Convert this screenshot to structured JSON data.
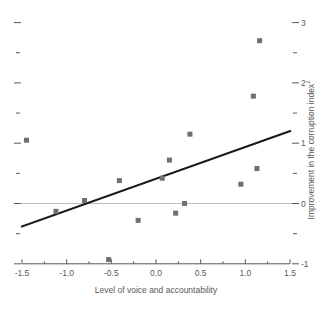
{
  "chart_data": {
    "type": "scatter",
    "title": "",
    "xlabel": "Level of voice and accountability",
    "ylabel": "Improvement in the corruption index²",
    "ylabel_text": "Improvement in the corruption index",
    "ylabel_superscript": "2",
    "xlim": [
      -1.5,
      1.5
    ],
    "ylim": [
      -1,
      3
    ],
    "xticks": [
      -1.5,
      -1.0,
      -0.5,
      0.0,
      0.5,
      1.0,
      1.5
    ],
    "xtick_labels": [
      "-1.5",
      "-1.0",
      "-0.5",
      "0.0",
      "0.5",
      "1.0",
      "1.5"
    ],
    "x_minor_ticks": [
      -1.25,
      -0.75,
      -0.25,
      0.25,
      0.75,
      1.25
    ],
    "yticks": [
      -1,
      0,
      1,
      2,
      3
    ],
    "ytick_labels": [
      "-1",
      "0",
      "1",
      "2",
      "3"
    ],
    "y_minor_ticks": [
      -0.5,
      0.5,
      1.5,
      2.5
    ],
    "y_axis_position": "right",
    "grid": false,
    "legend": null,
    "zero_line": 0,
    "points": [
      {
        "x": -1.45,
        "y": 1.05
      },
      {
        "x": -1.12,
        "y": -0.13
      },
      {
        "x": -0.8,
        "y": 0.05
      },
      {
        "x": -0.53,
        "y": -0.93
      },
      {
        "x": -0.41,
        "y": 0.38
      },
      {
        "x": -0.2,
        "y": -0.28
      },
      {
        "x": 0.07,
        "y": 0.42
      },
      {
        "x": 0.15,
        "y": 0.72
      },
      {
        "x": 0.22,
        "y": -0.16
      },
      {
        "x": 0.32,
        "y": 0.0
      },
      {
        "x": 0.38,
        "y": 1.15
      },
      {
        "x": 0.95,
        "y": 0.32
      },
      {
        "x": 1.09,
        "y": 1.78
      },
      {
        "x": 1.13,
        "y": 0.58
      },
      {
        "x": 1.16,
        "y": 2.7
      }
    ],
    "trendline": {
      "type": "linear-fit",
      "x_start": -1.5,
      "y_start": -0.38,
      "x_end": 1.5,
      "y_end": 1.2
    },
    "colors": {
      "marker": "#6e6f71",
      "trendline": "#1a1a1a",
      "axis": "#58595b",
      "zero_line": "#bcbdc0",
      "background": "#ffffff",
      "text": "#58595b"
    }
  }
}
